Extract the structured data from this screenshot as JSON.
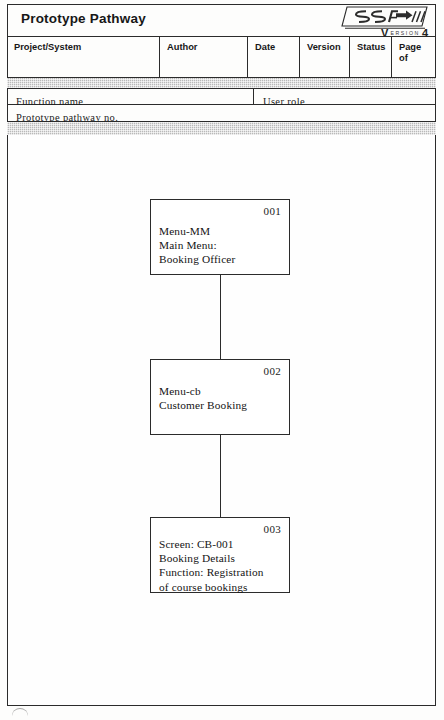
{
  "document": {
    "title": "Prototype Pathway",
    "logo": {
      "mark_text": "SSADM",
      "version_prefix": "V",
      "version_word": "ersion",
      "version_number": "4"
    }
  },
  "header_table": {
    "columns": [
      {
        "key": "project_system",
        "label": "Project/System",
        "value": ""
      },
      {
        "key": "author",
        "label": "Author",
        "value": ""
      },
      {
        "key": "date",
        "label": "Date",
        "value": ""
      },
      {
        "key": "version",
        "label": "Version",
        "value": ""
      },
      {
        "key": "status",
        "label": "Status",
        "value": ""
      },
      {
        "key": "page",
        "label": "Page\nof",
        "value": ""
      }
    ]
  },
  "meta_fields": {
    "function_name_label": "Function name",
    "function_name_value": "",
    "user_role_label": "User role",
    "user_role_value": "",
    "prototype_pathway_no_label": "Prototype pathway no.",
    "prototype_pathway_no_value": ""
  },
  "diagram": {
    "type": "flow-sequence",
    "nodes": [
      {
        "id": "001",
        "name": "node-001",
        "lines": "Menu-MM\nMain Menu:\nBooking Officer"
      },
      {
        "id": "002",
        "name": "node-002",
        "lines": "Menu-cb\nCustomer Booking"
      },
      {
        "id": "003",
        "name": "node-003",
        "lines": "Screen: CB-001\nBooking Details\nFunction: Registration\nof course bookings"
      }
    ],
    "connectors": [
      {
        "from": "001",
        "to": "002"
      },
      {
        "from": "002",
        "to": "003"
      }
    ]
  },
  "colors": {
    "ink": "#2b2b2b",
    "paper": "#fdfdfc",
    "band_gray": "#b9b9b9"
  }
}
